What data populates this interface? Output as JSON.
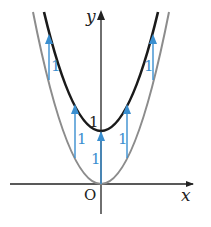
{
  "diagram": {
    "type": "function-graph-translation",
    "axes": {
      "x_label": "x",
      "y_label": "y",
      "origin_label": "O",
      "y_tick_label": "1"
    },
    "curves": [
      {
        "name": "base-parabola",
        "equation": "y = x^2",
        "color": "#8c8c8c"
      },
      {
        "name": "shifted-parabola",
        "equation": "y = x^2 + 1",
        "color": "#1a1a1a"
      }
    ],
    "shift_arrows": {
      "color": "#3a8fd0",
      "label": "1",
      "count": 5
    }
  }
}
